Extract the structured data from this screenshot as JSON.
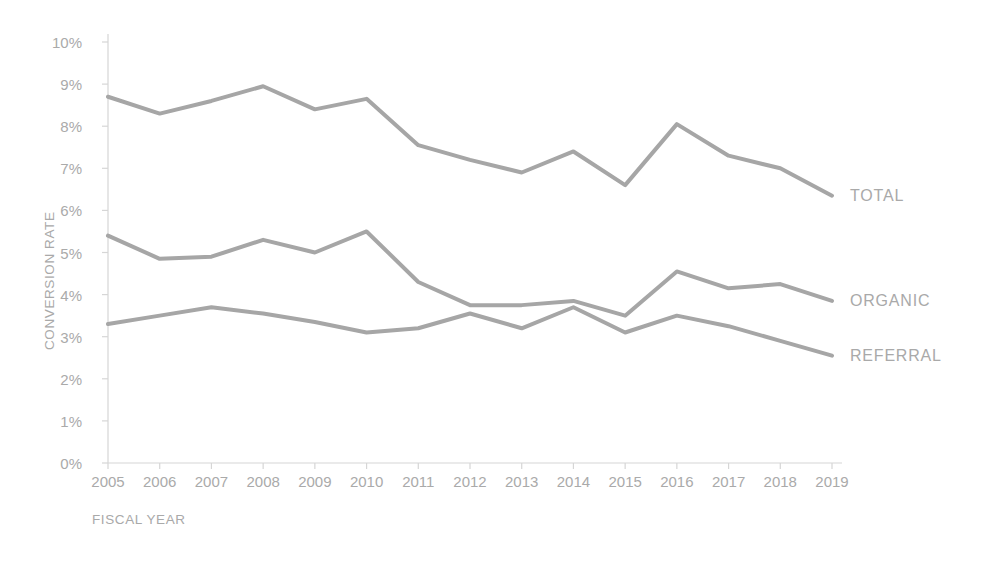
{
  "chart_data": {
    "type": "line",
    "title": "",
    "xlabel": "FISCAL YEAR",
    "ylabel": "CONVERSION RATE",
    "categories": [
      "2005",
      "2006",
      "2007",
      "2008",
      "2009",
      "2010",
      "2011",
      "2012",
      "2013",
      "2014",
      "2015",
      "2016",
      "2017",
      "2018",
      "2019"
    ],
    "x": [
      2005,
      2006,
      2007,
      2008,
      2009,
      2010,
      2011,
      2012,
      2013,
      2014,
      2015,
      2016,
      2017,
      2018,
      2019
    ],
    "ylim": [
      0,
      10
    ],
    "ytick_labels": [
      "0%",
      "1%",
      "2%",
      "3%",
      "4%",
      "5%",
      "6%",
      "7%",
      "8%",
      "9%",
      "10%"
    ],
    "ytick_values": [
      0,
      1,
      2,
      3,
      4,
      5,
      6,
      7,
      8,
      9,
      10
    ],
    "grid": false,
    "legend_position": "right-inline-labels",
    "series": [
      {
        "name": "TOTAL",
        "color": "#a6a6a6",
        "values": [
          8.7,
          8.3,
          8.6,
          8.95,
          8.4,
          8.65,
          7.55,
          7.2,
          6.9,
          7.4,
          6.6,
          8.05,
          7.3,
          7.0,
          6.35
        ]
      },
      {
        "name": "ORGANIC",
        "color": "#a6a6a6",
        "values": [
          5.4,
          4.85,
          4.9,
          5.3,
          5.0,
          5.5,
          4.3,
          3.75,
          3.75,
          3.85,
          3.5,
          4.55,
          4.15,
          4.25,
          3.85
        ]
      },
      {
        "name": "REFERRAL",
        "color": "#a6a6a6",
        "values": [
          3.3,
          3.5,
          3.7,
          3.55,
          3.35,
          3.1,
          3.2,
          3.55,
          3.2,
          3.7,
          3.1,
          3.5,
          3.25,
          2.9,
          2.55
        ]
      }
    ]
  },
  "axes": {
    "y_title": "CONVERSION RATE",
    "x_title": "FISCAL YEAR"
  },
  "style": {
    "line_color": "#a6a6a6",
    "axis_color": "#d6d6d6",
    "tick_text_color": "#aaaaaa",
    "background": "#ffffff",
    "line_width": 4
  }
}
